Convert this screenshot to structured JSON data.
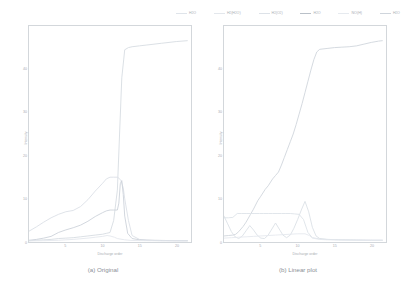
{
  "figure": {
    "background": "#ffffff",
    "axis_color": "#d3d7db",
    "text_color": "#a8adb3"
  },
  "legend": {
    "position": "top-right",
    "entries": [
      {
        "label": "H2O",
        "formula_base": "H",
        "formula_sub": "2",
        "formula_tail": "O",
        "color": "#dfe4ea"
      },
      {
        "label": "H2(H2O)",
        "formula_base": "H",
        "formula_sub": "2",
        "formula_tail": "(H2O)",
        "color": "#e3e7ec"
      },
      {
        "label": "H2(O2)",
        "formula_base": "H",
        "formula_sub": "2",
        "formula_tail": "(O2)",
        "color": "#dde2e8"
      },
      {
        "label": "H2O",
        "formula_base": "H",
        "formula_sub": "2",
        "formula_tail": "O",
        "color": "#b9c0c8"
      },
      {
        "label": "NO(H)",
        "formula_base": "N",
        "formula_sub": "",
        "formula_tail": "O(H)",
        "color": "#e6eaef"
      },
      {
        "label": "H2O",
        "formula_base": "H",
        "formula_sub": "2",
        "formula_tail": "O",
        "color": "#cfd5dc"
      }
    ]
  },
  "chart_data": [
    {
      "type": "line",
      "panel": "a",
      "title": "(a) Original",
      "xlabel": "Discharge order",
      "ylabel": "Intensity",
      "xlim": [
        0,
        22
      ],
      "ylim": [
        0,
        50
      ],
      "xticks": [
        5,
        10,
        15,
        20
      ],
      "yticks": [
        0,
        10,
        20,
        30,
        40
      ],
      "grid": false,
      "legend_position": "top-right-shared",
      "series": [
        {
          "name": "H2O",
          "color": "#d7dce2",
          "x": [
            0,
            1,
            2,
            3,
            4,
            5,
            6,
            7,
            8,
            9,
            10,
            10.5,
            11,
            11.5,
            12,
            12.3,
            12.6,
            13,
            13.5,
            14,
            15,
            16,
            18,
            20,
            21.5
          ],
          "y": [
            0.3,
            0.4,
            0.5,
            0.6,
            0.8,
            0.9,
            1.0,
            1.2,
            1.4,
            1.6,
            1.8,
            2.0,
            2.2,
            5.0,
            12.0,
            25.0,
            38.0,
            44.5,
            45.0,
            45.2,
            45.4,
            45.6,
            46.0,
            46.4,
            46.6
          ]
        },
        {
          "name": "H2(H2O)",
          "color": "#dbe0e6",
          "x": [
            0,
            1,
            2,
            3,
            4,
            5,
            6,
            7,
            8,
            9,
            10,
            10.5,
            11,
            11.5,
            12,
            12.2,
            12.5,
            12.8,
            13,
            13.5,
            14,
            15,
            16,
            18,
            20,
            21.5
          ],
          "y": [
            2.5,
            3.5,
            4.6,
            5.6,
            6.4,
            7.0,
            7.3,
            8.2,
            9.8,
            11.8,
            13.6,
            14.6,
            15.0,
            15.0,
            15.0,
            14.8,
            14.2,
            12.5,
            10.0,
            5.0,
            1.5,
            0.6,
            0.4,
            0.3,
            0.3,
            0.3
          ]
        },
        {
          "name": "H2(O2)",
          "color": "#cdd3da",
          "x": [
            0,
            1,
            2,
            3,
            4,
            5,
            6,
            7,
            8,
            9,
            10,
            10.5,
            11,
            11.5,
            12,
            12.2,
            12.4,
            12.6,
            12.8,
            13,
            13.4,
            14,
            15,
            17,
            20,
            21.5
          ],
          "y": [
            0.4,
            0.6,
            0.9,
            1.3,
            2.2,
            2.8,
            3.3,
            3.9,
            4.8,
            5.9,
            6.8,
            7.2,
            7.4,
            7.4,
            7.4,
            9.0,
            13.5,
            14.2,
            11.0,
            6.0,
            2.0,
            0.8,
            0.5,
            0.4,
            0.3,
            0.3
          ]
        },
        {
          "name": "NO(H)",
          "color": "#e4e8ed",
          "x": [
            0,
            2,
            4,
            6,
            8,
            9,
            10,
            10.6,
            11,
            11.6,
            12,
            13,
            14,
            16,
            18,
            20,
            21.5
          ],
          "y": [
            0.25,
            0.3,
            0.4,
            0.6,
            0.9,
            1.1,
            1.3,
            1.5,
            1.4,
            1.1,
            0.8,
            0.5,
            0.35,
            0.3,
            0.28,
            0.26,
            0.25
          ]
        }
      ]
    },
    {
      "type": "line",
      "panel": "b",
      "title": "(b) Linear plot",
      "xlabel": "Discharge order",
      "ylabel": "Intensity",
      "xlim": [
        0,
        22
      ],
      "ylim": [
        0,
        50
      ],
      "xticks": [
        5,
        10,
        15,
        20
      ],
      "yticks": [
        0,
        10,
        20,
        30,
        40
      ],
      "grid": false,
      "legend_position": "top-right-shared",
      "series": [
        {
          "name": "H2O",
          "color": "#d0d6dd",
          "x": [
            0,
            0.6,
            1.2,
            1.6,
            2,
            2.6,
            3,
            3.6,
            4,
            4.6,
            5,
            5.6,
            6,
            6.6,
            7,
            7.4,
            7.8,
            8.2,
            8.6,
            9,
            9.4,
            9.8,
            10.2,
            10.6,
            11,
            11.4,
            11.8,
            12.2,
            12.6,
            13,
            14,
            15,
            16,
            17,
            18,
            19,
            20,
            21,
            21.5
          ],
          "y": [
            1.4,
            1.5,
            1.6,
            1.8,
            2.4,
            3.6,
            4.6,
            6.4,
            7.6,
            9.6,
            10.6,
            12.2,
            13.0,
            14.6,
            15.4,
            16.2,
            17.8,
            19.6,
            21.4,
            23.2,
            25.0,
            27.2,
            29.6,
            32.0,
            34.6,
            37.2,
            39.8,
            42.2,
            44.0,
            44.6,
            44.8,
            45.0,
            45.1,
            45.2,
            45.4,
            45.8,
            46.2,
            46.5,
            46.6
          ]
        },
        {
          "name": "H2(H2O)",
          "color": "#dee3e9",
          "x": [
            0,
            0.6,
            1.2,
            1.8,
            2.4,
            3,
            3.6,
            4.2,
            4.8,
            5.4,
            6,
            6.6,
            7.2,
            7.8,
            8.4,
            9,
            9.6,
            10.2,
            10.8,
            11.4,
            12,
            13,
            14,
            16,
            18,
            20,
            21.5
          ],
          "y": [
            5.6,
            5.6,
            5.7,
            6.6,
            6.6,
            6.6,
            6.6,
            6.6,
            6.6,
            6.6,
            6.6,
            6.6,
            6.6,
            6.6,
            6.6,
            6.6,
            6.5,
            6.4,
            5.2,
            2.2,
            1.0,
            0.7,
            0.6,
            0.5,
            0.45,
            0.4,
            0.4
          ]
        },
        {
          "name": "H2(O2)",
          "color": "#dbe1e7",
          "x": [
            0,
            0.5,
            1,
            1.5,
            2,
            2.5,
            3,
            3.5,
            4,
            4.5,
            5,
            5.5,
            6,
            6.5,
            7,
            7.5,
            8,
            8.5,
            9,
            9.5,
            10,
            10.5,
            11,
            11.5,
            12,
            12.5,
            13,
            14,
            16,
            18,
            20,
            21.5
          ],
          "y": [
            6.0,
            4.2,
            2.4,
            1.2,
            0.8,
            1.4,
            2.6,
            3.8,
            2.8,
            1.6,
            0.9,
            0.8,
            1.6,
            3.0,
            4.4,
            3.0,
            1.6,
            1.0,
            1.6,
            3.2,
            5.2,
            7.4,
            9.4,
            7.0,
            3.4,
            1.4,
            0.8,
            0.6,
            0.5,
            0.45,
            0.4,
            0.4
          ]
        },
        {
          "name": "NO(H)",
          "color": "#e5e9ee",
          "x": [
            0,
            1,
            2,
            3,
            4,
            5,
            6,
            7,
            8,
            9,
            10,
            11,
            11.6,
            12,
            13,
            14,
            16,
            18,
            20,
            21.5
          ],
          "y": [
            0.9,
            1.0,
            1.1,
            1.2,
            1.3,
            1.4,
            1.5,
            1.6,
            1.7,
            1.8,
            1.9,
            1.9,
            1.5,
            0.9,
            0.6,
            0.5,
            0.45,
            0.4,
            0.4,
            0.4
          ]
        }
      ]
    }
  ]
}
